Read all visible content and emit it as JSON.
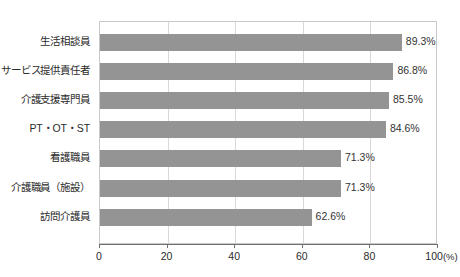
{
  "chart_data": {
    "type": "bar",
    "orientation": "horizontal",
    "title": "",
    "xlabel": "",
    "ylabel": "",
    "xlim": [
      0,
      100
    ],
    "xticks": [
      0,
      20,
      40,
      60,
      80,
      100
    ],
    "xtick_labels": [
      "0",
      "20",
      "40",
      "60",
      "80",
      "100"
    ],
    "x_unit_label": "(%)",
    "grid": "vertical",
    "legend": "none",
    "bar_color": "#949494",
    "categories": [
      "生活相談員",
      "サービス提供責任者",
      "介護支援専門員",
      "PT・OT・ST",
      "看護職員",
      "介護職員（施設）",
      "訪問介護員"
    ],
    "values": [
      89.3,
      86.8,
      85.5,
      84.6,
      71.3,
      71.3,
      62.6
    ],
    "value_labels": [
      "89.3%",
      "86.8%",
      "85.5%",
      "84.6%",
      "71.3%",
      "71.3%",
      "62.6%"
    ]
  },
  "caption": {
    "text": ""
  }
}
